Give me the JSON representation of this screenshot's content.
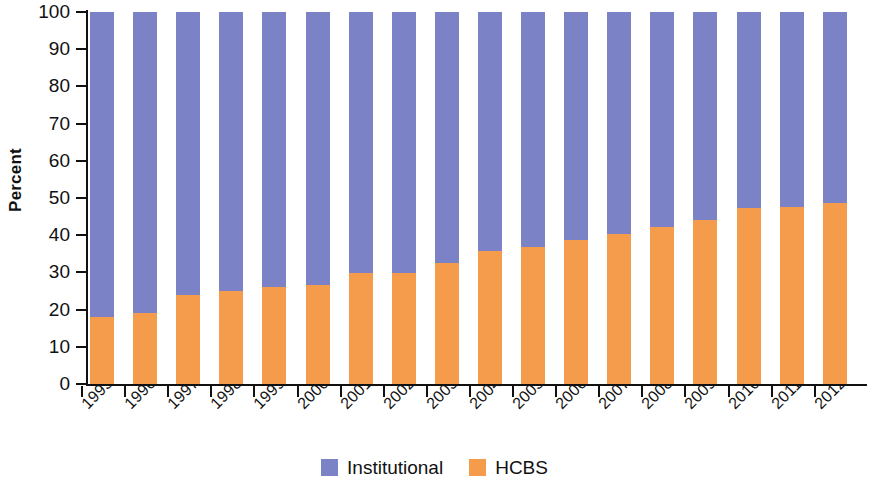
{
  "chart_data": {
    "type": "bar",
    "subtype": "stacked-100-percent",
    "title": "",
    "xlabel": "",
    "ylabel": "Percent",
    "ylim": [
      0,
      100
    ],
    "ytick_labels": [
      "0",
      "10",
      "20",
      "30",
      "40",
      "50",
      "60",
      "70",
      "80",
      "90",
      "100"
    ],
    "ytick_values": [
      0,
      10,
      20,
      30,
      40,
      50,
      60,
      70,
      80,
      90,
      100
    ],
    "grid": false,
    "legend_position": "bottom-center",
    "categories": [
      "1995",
      "1996",
      "1997",
      "1998",
      "1999",
      "2000",
      "2001",
      "2002",
      "2003",
      "2004",
      "2005",
      "2006",
      "2007",
      "2008",
      "2009",
      "2010",
      "2011",
      "2012"
    ],
    "series": [
      {
        "name": "HCBS",
        "color": "#f59b4c",
        "values": [
          18,
          19,
          24,
          25,
          26,
          26.5,
          29.8,
          29.8,
          32.5,
          35.8,
          36.7,
          38.8,
          40.4,
          42.3,
          44.2,
          47.4,
          47.5,
          48.7
        ]
      },
      {
        "name": "Institutional",
        "color": "#7b82c6",
        "values": [
          82,
          81,
          76,
          75,
          74,
          73.5,
          70.2,
          70.2,
          67.5,
          64.2,
          63.3,
          61.2,
          59.6,
          57.7,
          55.8,
          52.6,
          52.5,
          51.3
        ]
      }
    ],
    "legend": [
      {
        "label": "Institutional",
        "color": "#7b82c6"
      },
      {
        "label": "HCBS",
        "color": "#f59b4c"
      }
    ]
  }
}
